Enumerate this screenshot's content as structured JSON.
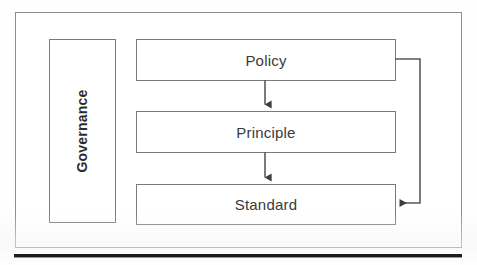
{
  "diagram": {
    "frame": {
      "name": "outer-frame"
    },
    "nodes": [
      {
        "id": "governance",
        "label": "Governance",
        "orientation": "vertical",
        "x": 48,
        "y": 38,
        "w": 67,
        "h": 184
      },
      {
        "id": "policy",
        "label": "Policy",
        "orientation": "horizontal",
        "x": 135,
        "y": 38,
        "w": 260,
        "h": 42
      },
      {
        "id": "principle",
        "label": "Principle",
        "orientation": "horizontal",
        "x": 135,
        "y": 110,
        "w": 260,
        "h": 42
      },
      {
        "id": "standard",
        "label": "Standard",
        "orientation": "horizontal",
        "x": 135,
        "y": 183,
        "w": 260,
        "h": 41
      }
    ],
    "connectors": [
      {
        "id": "policy-to-principle",
        "from": "policy",
        "to": "principle",
        "kind": "straight-down",
        "arrow": "down",
        "path": "M 265 80 L 265 106"
      },
      {
        "id": "principle-to-standard",
        "from": "principle",
        "to": "standard",
        "kind": "straight-down",
        "arrow": "down",
        "path": "M 265 152 L 265 179"
      },
      {
        "id": "policy-to-standard-feedback",
        "from": "policy",
        "to": "standard",
        "kind": "right-side-loop",
        "arrow": "left",
        "path": "M 395 59 L 420 59 L 420 203 L 400 203"
      }
    ],
    "colors": {
      "box_border": "#7a7a7a",
      "frame_border": "#8d8d8d",
      "connector": "#5a5a5a",
      "label_text": "#3a3a3a",
      "governance_text": "#2b2b2b",
      "rule": "#1c1c1c",
      "background": "#ffffff"
    },
    "bottom_rule": {
      "name": "horizontal-rule",
      "x": 14,
      "y": 254,
      "w": 448,
      "h": 3
    }
  }
}
